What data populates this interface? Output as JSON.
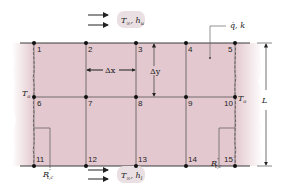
{
  "diagram": {
    "type": "2D finite-difference nodal network",
    "colors": {
      "fill": "#e3c9cf",
      "edge_fade": "#f2e4e7",
      "line": "#3a3a3a",
      "node": "#111111",
      "bubble": "#eadfe2"
    },
    "top_flow": {
      "label_T": "T",
      "label_T_sub": "∞",
      "label_h": "h",
      "label_h_sub": "u",
      "separator": ", "
    },
    "bottom_flow": {
      "label_T": "T",
      "label_T_sub": "∞",
      "label_h": "h",
      "label_h_sub": "l",
      "separator": ", "
    },
    "generation_label": {
      "text": "q̇, k"
    },
    "left_temp": {
      "T": "T",
      "sub": "o"
    },
    "right_temp": {
      "T": "T",
      "sub": "o"
    },
    "dx_label": "Δx",
    "dy_label": "Δy",
    "L_label": "L",
    "contact_left": {
      "R": "R",
      "sup": "″",
      "sub": "t,c"
    },
    "contact_right": {
      "R": "R",
      "sup": "″",
      "sub": "t,c"
    },
    "nodes": [
      {
        "id": "1"
      },
      {
        "id": "2"
      },
      {
        "id": "3"
      },
      {
        "id": "4"
      },
      {
        "id": "5"
      },
      {
        "id": "6"
      },
      {
        "id": "7"
      },
      {
        "id": "8"
      },
      {
        "id": "9"
      },
      {
        "id": "10"
      },
      {
        "id": "11"
      },
      {
        "id": "12"
      },
      {
        "id": "13"
      },
      {
        "id": "14"
      },
      {
        "id": "15"
      }
    ]
  }
}
